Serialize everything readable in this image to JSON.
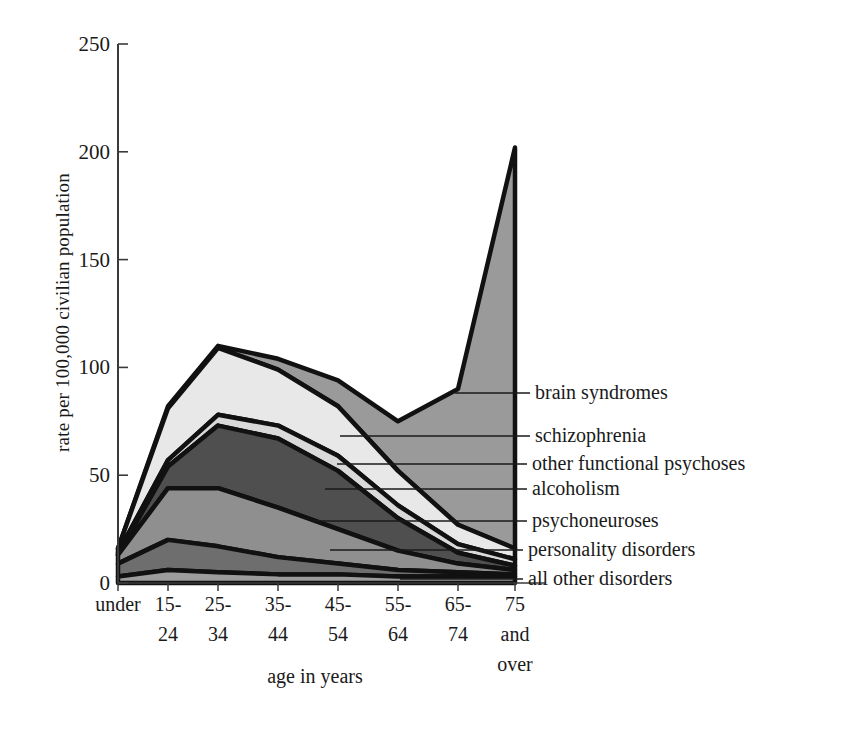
{
  "chart_data": {
    "type": "area",
    "stacked": true,
    "title": "",
    "xlabel": "age in years",
    "ylabel": "rate per 100,000 civilian population",
    "ylim": [
      0,
      250
    ],
    "yticks": [
      0,
      50,
      100,
      150,
      200,
      250
    ],
    "ytick_labels": [
      "0",
      "50",
      "100",
      "150",
      "200",
      "250"
    ],
    "grid": false,
    "legend_position": "right-inline-leaders",
    "categories": [
      "under 15",
      "15-24",
      "25-34",
      "35-44",
      "45-54",
      "55-64",
      "65-74",
      "75 and over"
    ],
    "category_lines": [
      [
        "under",
        ""
      ],
      [
        "15-",
        "24"
      ],
      [
        "25-",
        "34"
      ],
      [
        "35-",
        "44"
      ],
      [
        "45-",
        "54"
      ],
      [
        "55-",
        "64"
      ],
      [
        "65-",
        "74"
      ],
      [
        "75",
        "and",
        "over"
      ]
    ],
    "series": [
      {
        "name": "all other disorders",
        "color": "#9c9c9c",
        "values": [
          3,
          6,
          5,
          4,
          4,
          3,
          3,
          3
        ]
      },
      {
        "name": "personality disorders",
        "color": "#6e6e6e",
        "values": [
          6,
          14,
          12,
          8,
          5,
          3,
          2,
          1
        ]
      },
      {
        "name": "psychoneuroses",
        "color": "#8f8f8f",
        "values": [
          4,
          24,
          27,
          23,
          16,
          9,
          4,
          2
        ]
      },
      {
        "name": "alcoholism",
        "color": "#4f4f4f",
        "values": [
          0,
          10,
          29,
          32,
          27,
          15,
          5,
          2
        ]
      },
      {
        "name": "other functional psychoses",
        "color": "#d9d9d9",
        "values": [
          1,
          3,
          5,
          6,
          7,
          6,
          4,
          3
        ]
      },
      {
        "name": "schizophrenia",
        "color": "#e8e8e8",
        "values": [
          2,
          24,
          31,
          26,
          23,
          16,
          9,
          5
        ]
      },
      {
        "name": "brain syndromes",
        "color": "#9a9a9a",
        "values": [
          0,
          1,
          1,
          5,
          12,
          23,
          63,
          186
        ]
      }
    ],
    "series_totals": [
      16,
      82,
      110,
      104,
      94,
      75,
      90,
      202
    ],
    "legend": [
      {
        "label": "brain syndromes"
      },
      {
        "label": "schizophrenia"
      },
      {
        "label": "other functional psychoses"
      },
      {
        "label": "alcoholism"
      },
      {
        "label": "psychoneuroses"
      },
      {
        "label": "personality disorders"
      },
      {
        "label": "all other disorders"
      }
    ],
    "annotations": []
  },
  "axes": {
    "y_axis_title": "rate per 100,000 civilian population",
    "x_axis_title": "age in years"
  },
  "colors": {
    "background": "#ffffff",
    "axis": "#3a3a3a",
    "outline": "#111111",
    "text": "#1a1a1a"
  }
}
